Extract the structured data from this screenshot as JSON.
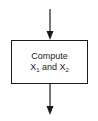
{
  "diagram": {
    "type": "flowchart-process-step",
    "process_box": {
      "line1": "Compute",
      "line2_var1": "X",
      "line2_sub1": "1",
      "line2_mid": " and ",
      "line2_var2": "X",
      "line2_sub2": "2"
    },
    "arrows": [
      {
        "name": "incoming",
        "direction": "down"
      },
      {
        "name": "outgoing",
        "direction": "down"
      }
    ],
    "colors": {
      "stroke": "#1a1a1a",
      "background": "#ffffff"
    }
  }
}
